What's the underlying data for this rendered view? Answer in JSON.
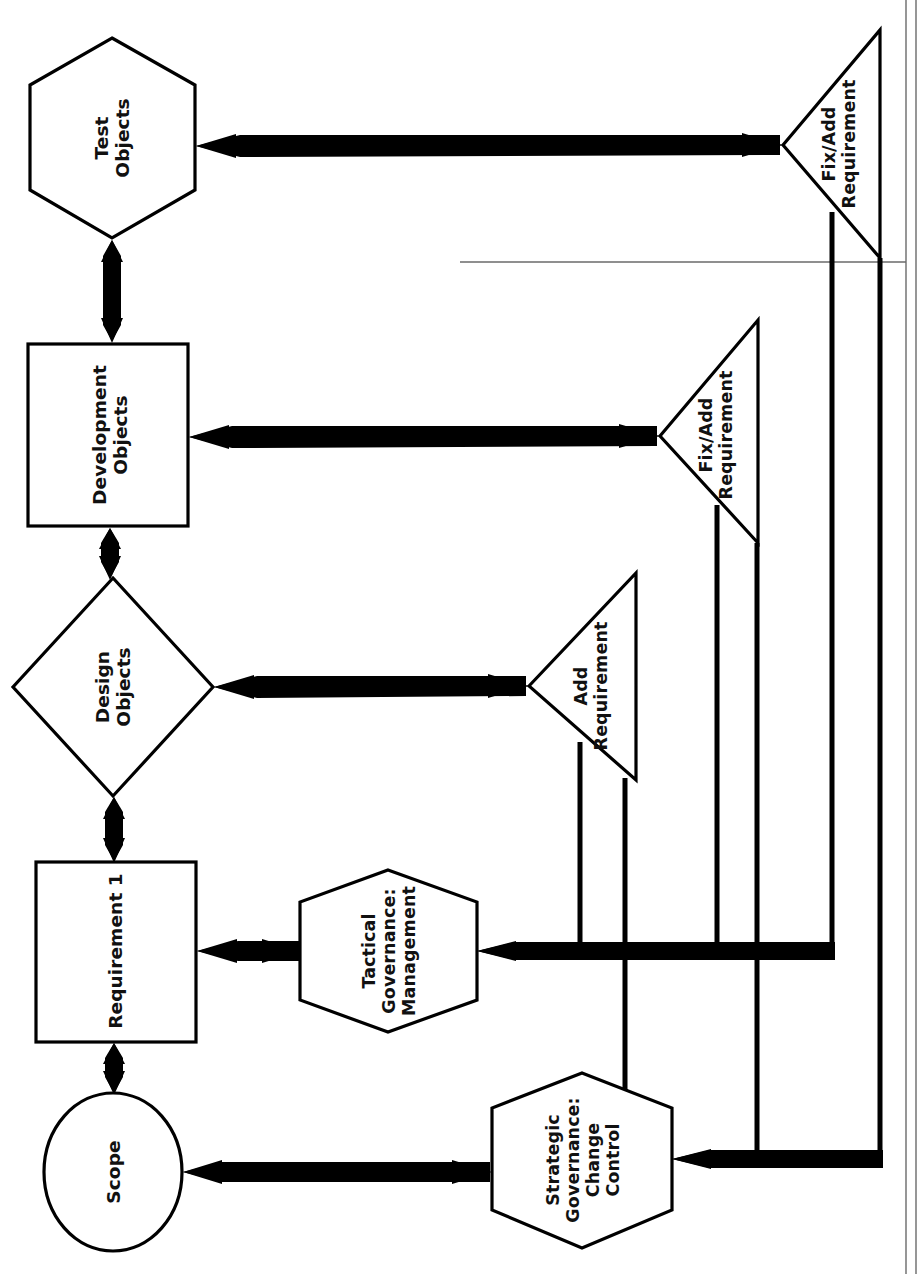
{
  "diagram": {
    "orientation": "rotated-90-ccw",
    "background_color": "#ffffff",
    "line_color": "#000000",
    "text_color": "#111111",
    "nodes": [
      {
        "id": "test_objects",
        "label": "Test\nObjects",
        "shape": "hexagon"
      },
      {
        "id": "development_objects",
        "label": "Development\nObjects",
        "shape": "rectangle"
      },
      {
        "id": "design_objects",
        "label": "Design\nObjects",
        "shape": "diamond"
      },
      {
        "id": "requirement_1",
        "label": "Requirement 1",
        "shape": "rectangle"
      },
      {
        "id": "scope",
        "label": "Scope",
        "shape": "ellipse"
      },
      {
        "id": "tactical_governance",
        "label": "Tactical\nGovernance:\nManagement",
        "shape": "hexagon"
      },
      {
        "id": "strategic_governance",
        "label": "Strategic\nGovernance:\nChange\nControl",
        "shape": "hexagon"
      },
      {
        "id": "fix_add_top",
        "label": "Fix/Add\nRequirement",
        "shape": "triangle"
      },
      {
        "id": "fix_add_mid",
        "label": "Fix/Add\nRequirement",
        "shape": "triangle"
      },
      {
        "id": "add_requirement",
        "label": "Add\nRequirement",
        "shape": "triangle"
      }
    ],
    "edges": [
      {
        "from": "test_objects",
        "to": "development_objects",
        "style": "arrow"
      },
      {
        "from": "development_objects",
        "to": "design_objects",
        "style": "arrow"
      },
      {
        "from": "design_objects",
        "to": "requirement_1",
        "style": "arrow"
      },
      {
        "from": "requirement_1",
        "to": "scope",
        "style": "arrow"
      },
      {
        "from": "test_objects",
        "to": "fix_add_top",
        "style": "arrow"
      },
      {
        "from": "development_objects",
        "to": "fix_add_mid",
        "style": "arrow"
      },
      {
        "from": "design_objects",
        "to": "add_requirement",
        "style": "arrow"
      },
      {
        "from": "requirement_1",
        "to": "tactical_governance",
        "style": "arrow"
      },
      {
        "from": "scope",
        "to": "strategic_governance",
        "style": "arrow"
      },
      {
        "from": "fix_add_top",
        "to": "tactical_governance",
        "style": "routed"
      },
      {
        "from": "fix_add_top",
        "to": "strategic_governance",
        "style": "routed"
      },
      {
        "from": "fix_add_mid",
        "to": "tactical_governance",
        "style": "routed"
      },
      {
        "from": "fix_add_mid",
        "to": "strategic_governance",
        "style": "routed"
      },
      {
        "from": "add_requirement",
        "to": "tactical_governance",
        "style": "routed"
      },
      {
        "from": "add_requirement",
        "to": "strategic_governance",
        "style": "routed"
      }
    ]
  },
  "labels": {
    "test_objects": "Test\nObjects",
    "development_objects": "Development\nObjects",
    "design_objects": "Design\nObjects",
    "requirement_1": "Requirement 1",
    "scope": "Scope",
    "tactical_governance": "Tactical\nGovernance:\nManagement",
    "strategic_governance": "Strategic\nGovernance:\nChange\nControl",
    "fix_add_top": "Fix/Add\nRequirement",
    "fix_add_mid": "Fix/Add\nRequirement",
    "add_requirement": "Add\nRequirement"
  }
}
